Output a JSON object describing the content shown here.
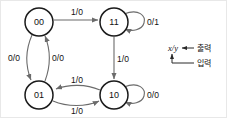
{
  "diagram": {
    "type": "state-transition-diagram",
    "title": "",
    "states": [
      {
        "id": "s00",
        "label": "00",
        "cx": 38,
        "cy": 21,
        "r": 14
      },
      {
        "id": "s11",
        "label": "11",
        "cx": 113,
        "cy": 21,
        "r": 14
      },
      {
        "id": "s01",
        "label": "01",
        "cx": 38,
        "cy": 94,
        "r": 14
      },
      {
        "id": "s10",
        "label": "10",
        "cx": 113,
        "cy": 94,
        "r": 14
      }
    ],
    "transitions": [
      {
        "id": "t-00-11",
        "from": "00",
        "to": "11",
        "label": "1/0",
        "label_x": 76,
        "label_y": 11
      },
      {
        "id": "t-11-11",
        "from": "11",
        "to": "11",
        "label": "0/1",
        "label_x": 152,
        "label_y": 21,
        "self_loop": true
      },
      {
        "id": "t-11-10",
        "from": "11",
        "to": "10",
        "label": "1/0",
        "label_x": 122,
        "label_y": 58
      },
      {
        "id": "t-00-01",
        "from": "00",
        "to": "01",
        "label": "0/0",
        "label_x": 13,
        "label_y": 57
      },
      {
        "id": "t-01-00",
        "from": "01",
        "to": "00",
        "label": "0/0",
        "label_x": 57,
        "label_y": 57
      },
      {
        "id": "t-10-01",
        "from": "10",
        "to": "01",
        "label": "1/0",
        "label_x": 76,
        "label_y": 79
      },
      {
        "id": "t-01-10",
        "from": "01",
        "to": "10",
        "label": "1/0",
        "label_x": 76,
        "label_y": 110
      },
      {
        "id": "t-10-10",
        "from": "10",
        "to": "10",
        "label": "0/0",
        "label_x": 152,
        "label_y": 94,
        "self_loop": true
      }
    ]
  },
  "legend": {
    "notation": "x/y",
    "output_label": "출력",
    "input_label": "입력"
  },
  "colors": {
    "node_stroke": "#1a1a1a",
    "edge_stroke": "#6b6b6b",
    "text": "#111111",
    "background": "#ffffff",
    "border": "#e8e8e8"
  }
}
